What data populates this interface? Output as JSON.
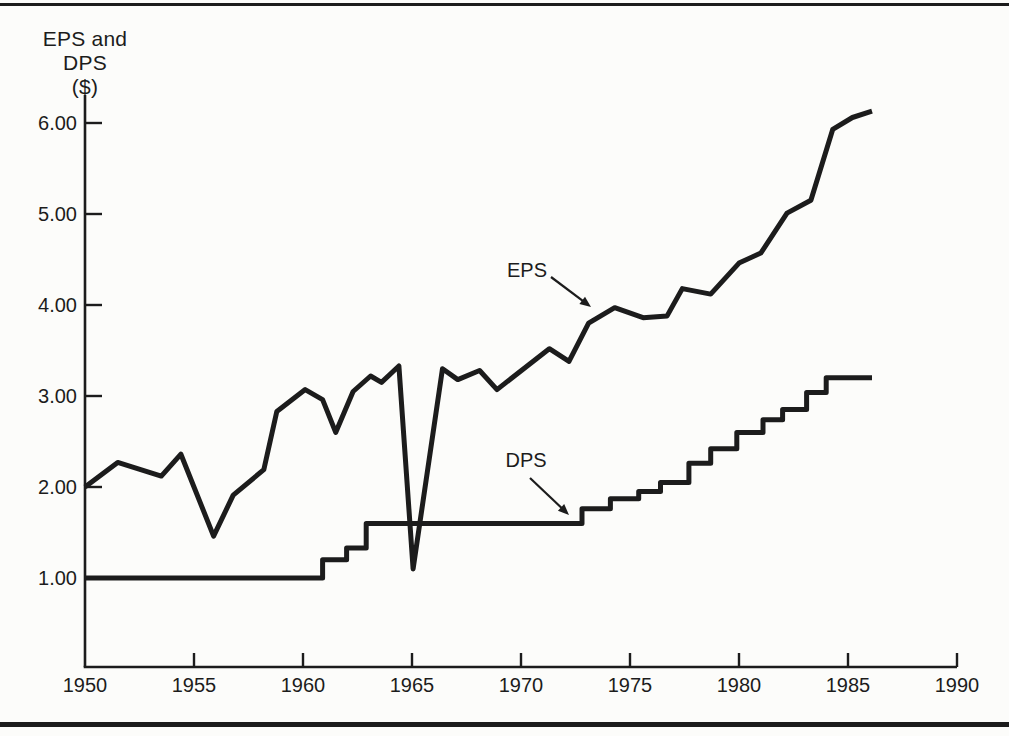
{
  "page": {
    "background": "#fcfcfa",
    "ink": "#1c1c1c"
  },
  "chart_data": {
    "type": "line",
    "ylabel": "EPS and DPS",
    "ylabel_unit": "($)",
    "xlabel": "",
    "xlim": [
      1950,
      1990
    ],
    "ylim": [
      0,
      6.3
    ],
    "grid": false,
    "legend_position": "inline-arrow-annotations",
    "x_ticks": [
      1950,
      1955,
      1960,
      1965,
      1970,
      1975,
      1980,
      1985,
      1990
    ],
    "y_ticks": [
      1,
      2,
      3,
      4,
      5,
      6
    ],
    "y_tick_labels": [
      "1.00",
      "2.00",
      "3.00",
      "4.00",
      "5.00",
      "6.00"
    ],
    "series": [
      {
        "name": "EPS",
        "style": "line",
        "points": [
          [
            1950,
            2.0
          ],
          [
            1951.5,
            2.27
          ],
          [
            1953.5,
            2.12
          ],
          [
            1954.4,
            2.36
          ],
          [
            1955.9,
            1.46
          ],
          [
            1956.8,
            1.91
          ],
          [
            1958.2,
            2.19
          ],
          [
            1958.8,
            2.83
          ],
          [
            1960.1,
            3.07
          ],
          [
            1960.9,
            2.96
          ],
          [
            1961.5,
            2.6
          ],
          [
            1962.3,
            3.05
          ],
          [
            1963.1,
            3.22
          ],
          [
            1963.6,
            3.15
          ],
          [
            1964.4,
            3.33
          ],
          [
            1965.05,
            1.1
          ],
          [
            1966.4,
            3.3
          ],
          [
            1967.1,
            3.18
          ],
          [
            1968.1,
            3.28
          ],
          [
            1968.9,
            3.07
          ],
          [
            1971.3,
            3.52
          ],
          [
            1972.2,
            3.38
          ],
          [
            1973.1,
            3.8
          ],
          [
            1974.3,
            3.97
          ],
          [
            1975.6,
            3.86
          ],
          [
            1976.7,
            3.88
          ],
          [
            1977.4,
            4.18
          ],
          [
            1978.7,
            4.12
          ],
          [
            1980,
            4.46
          ],
          [
            1981,
            4.57
          ],
          [
            1982.2,
            5.01
          ],
          [
            1983.3,
            5.15
          ],
          [
            1984.3,
            5.93
          ],
          [
            1985.2,
            6.06
          ],
          [
            1986.1,
            6.13
          ]
        ]
      },
      {
        "name": "DPS",
        "style": "step-after",
        "end_year": 1986.1,
        "points": [
          [
            1950,
            1.0
          ],
          [
            1960.9,
            1.2
          ],
          [
            1962,
            1.33
          ],
          [
            1962.9,
            1.6
          ],
          [
            1972.8,
            1.76
          ],
          [
            1974.1,
            1.87
          ],
          [
            1975.4,
            1.95
          ],
          [
            1976.4,
            2.05
          ],
          [
            1977.7,
            2.26
          ],
          [
            1978.7,
            2.42
          ],
          [
            1979.9,
            2.6
          ],
          [
            1981.1,
            2.74
          ],
          [
            1982,
            2.85
          ],
          [
            1983.1,
            3.04
          ],
          [
            1984,
            3.2
          ]
        ]
      }
    ],
    "annotations": [
      {
        "label": "EPS",
        "arrow_from": [
          551,
          277
        ],
        "arrow_to": [
          591,
          307
        ]
      },
      {
        "label": "DPS",
        "arrow_from": [
          530,
          478
        ],
        "arrow_to": [
          569,
          515
        ]
      }
    ]
  }
}
